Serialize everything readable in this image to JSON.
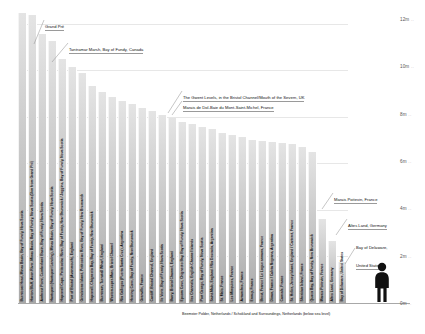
{
  "chart_data": {
    "type": "bar",
    "title": "",
    "xlabel": "",
    "ylabel": "",
    "ylim": [
      0,
      12.8
    ],
    "grid": true,
    "unit": "m",
    "ytick_labels": [
      "12m",
      "10m",
      "8m",
      "6m",
      "4m",
      "2m",
      "0m"
    ],
    "ytick_values": [
      12,
      10,
      8,
      6,
      4,
      2,
      0
    ],
    "categories": [
      "Burntcoat Head, Minas Basin, Bay of Fundy, Nova Scotia",
      "Horton Bluff, Avon River, Minas Basin, Bay of Fundy, Nova Scotia (5km from Grand Pré)",
      "Amherst Point, Cumberland Basin, Bay of Fundy, Nova Scotia",
      "Hantsport (Hantsport Landing), Minas Basin, Bay of Fundy, Nova Scotia",
      "Hopewell Cape, Petitcodiac River, Bay of Fundy, New Brunswick / Joggins, Bay of Fundy, Nova Scotia",
      "Port of Bristol (Avonmouth), England",
      "Grindstone Island, Petitcodiac River, Bay of Fundy, New Brunswick",
      "Hopewell, Chignecto Bay, Bay of Fundy, New Brunswick",
      "Burntown, Turnstall Wharf, England",
      "Weston-super-Mare, Bristol Channel",
      "Rio Gallegos (Puerto Santa Cruz), Argentina",
      "Herring Cove, Bay of Fundy, New Brunswick",
      "Granville, France",
      "Cardiff, Bristol Channel, England",
      "Ile Verte, Bay of Fundy, Nova Scotia",
      "Barry, Bristol Channel, England",
      "Epsom Cove, Chignecto Bay, Bay of Fundy, Nova Scotia",
      "Ilex Channels, English Channel Islands",
      "Port George, Bay of Fundy, Nova Scotia",
      "Saint-Malo, England / Rio Deseado, Argentina",
      "St. Malo, France",
      "Les Minquiers, France",
      "Avranches, France",
      "Ennuy, France",
      "Brest, France / Le Logue armano, France",
      "Dinan, France / Caleta Negrana, Argentina",
      "Cancale, France",
      "St. Helier, Jersey Island, England / Carteret, France",
      "Sheridan Island, France",
      "Quaco Bay, Bay of Fundy, New Brunswick",
      "Marais Poitevin, France",
      "Altes Land, Germany",
      "Bay of Delaware, United States"
    ],
    "values": [
      12.25,
      12.15,
      11.35,
      11.05,
      10.3,
      9.95,
      9.7,
      9.15,
      8.9,
      8.7,
      8.55,
      8.4,
      8.25,
      8.1,
      7.95,
      7.8,
      7.65,
      7.55,
      7.45,
      7.35,
      7.2,
      7.1,
      7.0,
      6.9,
      6.85,
      6.8,
      6.75,
      6.7,
      6.6,
      6.4,
      3.55,
      2.6,
      1.75
    ],
    "annotations": [
      {
        "label": "Grand Pré",
        "bar_index": 1
      },
      {
        "label": "Tantramar Marsh, Bay of Fundy, Canada",
        "bar_index": 3
      },
      {
        "label": "The Gwent Levels, in the Bristol Channel/Mouth of the Severn, UK",
        "bar_index": 17
      },
      {
        "label": "Marais de Dol-Baie du Mont-Saint-Michel, France",
        "bar_index": 19
      },
      {
        "label": "Marais Poitevin, France",
        "bar_index": 30
      },
      {
        "label": "Altes Land, Germany",
        "bar_index": 31
      },
      {
        "label": "Bay of Delaware,\nUnited States",
        "bar_index": 32
      }
    ],
    "footnote": "Beemster Polder, Netherlands / Schokland and Surroundings, Netherlands (below sea level)"
  },
  "callouts": {
    "grand_pre": "Grand Pré",
    "tantramar": "Tantramar Marsh, Bay of Fundy, Canada",
    "gwent": "The Gwent Levels, in the Bristol Channel/Mouth of the Severn, UK",
    "dol": "Marais de Dol-Baie du Mont-Saint-Michel, France",
    "poitevin": "Marais Poitevin, France",
    "altes": "Altes Land, Germany",
    "delaware_line1": "Bay of Delaware,",
    "delaware_line2": "United States"
  },
  "footnote_text": "Beemster Polder, Netherlands / Schokland and Surroundings, Netherlands (below sea level)",
  "axis": {
    "ticks": [
      "12m",
      "10m",
      "8m",
      "6m",
      "4m",
      "2m",
      "0m"
    ],
    "dots": ".."
  },
  "scale_figure": {
    "name": "human-silhouette"
  }
}
